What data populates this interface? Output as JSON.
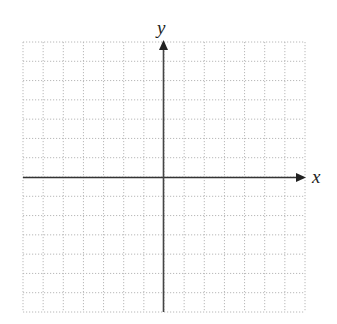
{
  "chart_data": {
    "type": "coordinate-plane",
    "title": "",
    "xlabel": "x",
    "ylabel": "y",
    "grid": true,
    "grid_style": "dotted",
    "columns_left_of_origin": 7,
    "columns_right_of_origin": 7,
    "rows_above_origin": 7,
    "rows_below_origin": 7,
    "xlim": [
      -7,
      7
    ],
    "ylim": [
      -7,
      7
    ],
    "arrows": [
      "positive-x",
      "positive-y"
    ],
    "series": []
  },
  "labels": {
    "x_axis": "x",
    "y_axis": "y"
  },
  "colors": {
    "grid": "#b8b8b8",
    "axis": "#333333",
    "background": "#ffffff"
  }
}
